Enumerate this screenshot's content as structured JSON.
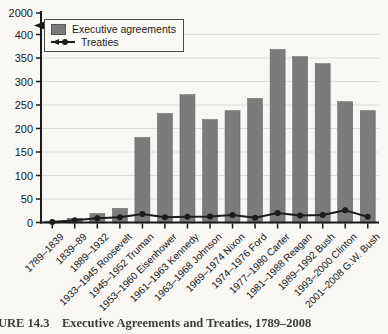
{
  "figure": {
    "caption": "URE 14.3    Executive Agreements and Treaties, 1789–2008"
  },
  "legend": {
    "executive_agreements": "Executive agreements",
    "treaties": "Treaties"
  },
  "colors": {
    "bar": "#7b7b7b",
    "bar_edge": "#5f5f5f",
    "line": "#1c1c1c",
    "grid": "#dddcd8",
    "axis": "#1a1a1a",
    "page_background": "#f8f7f4"
  },
  "chart_data": {
    "type": "bar",
    "title": "",
    "xlabel": "",
    "ylabel": "",
    "categories": [
      "1789–1839",
      "1839–89",
      "1889–1932",
      "1933–1945 Roosevelt",
      "1945–1952 Truman",
      "1953–1960 Eisenhower",
      "1961–1963 Kennedy",
      "1963–1968 Johnson",
      "1969–1974 Nixon",
      "1974–1976 Ford",
      "1977–1980 Carter",
      "1981–1988 Reagan",
      "1989–1992 Bush",
      "1993–2000 Clinton",
      "2001–2008 G.W. Bush"
    ],
    "series": [
      {
        "name": "Executive agreements",
        "type": "bar",
        "color": "#7b7b7b",
        "values": [
          3,
          9,
          19,
          30,
          181,
          232,
          272,
          219,
          238,
          264,
          368,
          353,
          338,
          257,
          238
        ]
      },
      {
        "name": "Treaties",
        "type": "line",
        "color": "#1c1c1c",
        "values": [
          1,
          5,
          9,
          11,
          18,
          11,
          12,
          13,
          16,
          10,
          20,
          15,
          16,
          26,
          12
        ]
      }
    ],
    "ylim": [
      0,
      400
    ],
    "y_ticks": [
      0,
      50,
      100,
      150,
      200,
      250,
      300,
      350,
      400
    ],
    "y_axis_break_top_label": "2000",
    "grid": "horizontal-light",
    "legend_position": "top-left"
  }
}
